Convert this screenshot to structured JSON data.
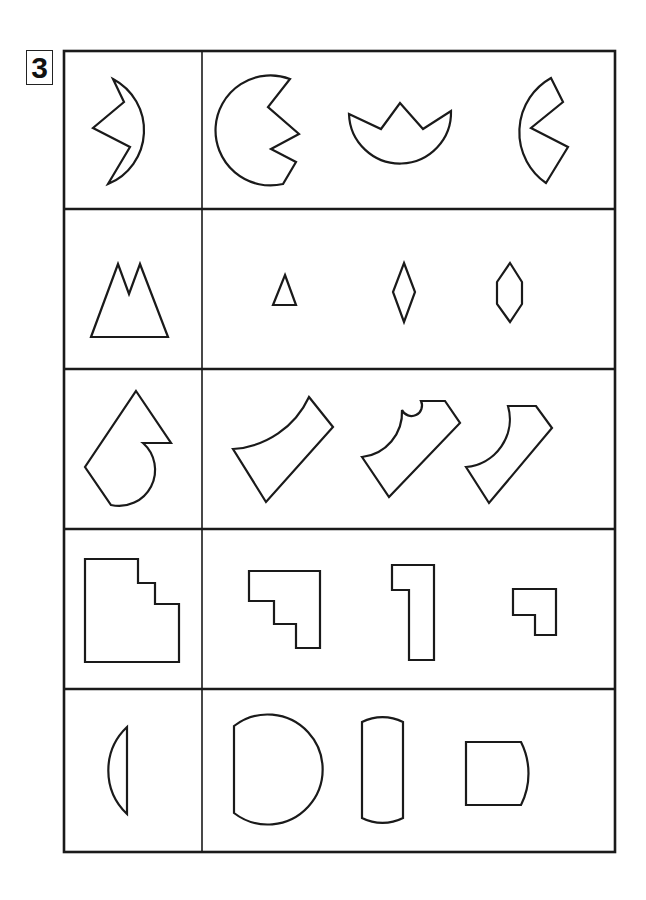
{
  "problem": {
    "number": "3"
  },
  "rows": [
    {
      "index": 1,
      "reference": "circle-with-zigzag-notch",
      "options": [
        "circle-with-double-notch",
        "semicircle-crown",
        "circle-with-wedge-notch"
      ]
    },
    {
      "index": 2,
      "reference": "twin-peak-mountain",
      "options": [
        "small-triangle",
        "rhombus",
        "hexagon"
      ]
    },
    {
      "index": 3,
      "reference": "square-with-arrow-and-arc",
      "options": [
        "curved-wedge-a",
        "curved-wedge-b",
        "curved-wedge-c"
      ]
    },
    {
      "index": 4,
      "reference": "stepped-square",
      "options": [
        "stepped-l",
        "tall-l",
        "small-l"
      ]
    },
    {
      "index": 5,
      "reference": "circular-segment",
      "options": [
        "d-shape",
        "capsule-rect",
        "square-with-arc"
      ]
    }
  ],
  "colors": {
    "stroke": "#1a1a1a",
    "background": "#ffffff"
  }
}
